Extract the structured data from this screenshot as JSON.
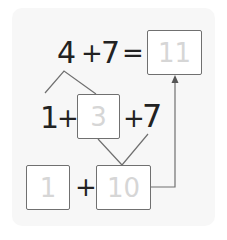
{
  "equation": {
    "left": "4",
    "plus1": "+",
    "right": "7",
    "equals": "=",
    "answer": "11"
  },
  "split_row": {
    "part1": "1",
    "plus1": "+",
    "part2": "3",
    "plus2": "+",
    "addend": "7"
  },
  "sum_row": {
    "box1": "1",
    "plus": "+",
    "box2": "10"
  },
  "colors": {
    "line": "#707070",
    "text": "#222222",
    "box_text": "#d6d6d6",
    "panel": "#f7f7f7"
  }
}
